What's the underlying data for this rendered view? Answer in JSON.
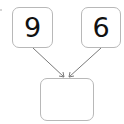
{
  "diagram": {
    "inputs": [
      {
        "label": "9"
      },
      {
        "label": "6"
      }
    ],
    "result": {
      "label": ""
    },
    "colors": {
      "border": "#b8b8b8",
      "arrow": "#7a7a7a",
      "text": "#111111"
    }
  }
}
